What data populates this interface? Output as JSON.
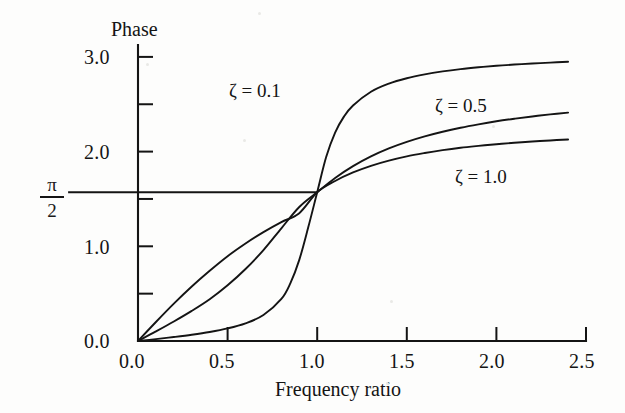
{
  "figure": {
    "background_color": "#fdfdfc",
    "ink_color": "#141414"
  },
  "chart_data": {
    "type": "line",
    "title": "",
    "xlabel": "Frequency ratio",
    "ylabel": "Phase",
    "xlim": [
      0.0,
      2.5
    ],
    "ylim": [
      0.0,
      3.2
    ],
    "xticks": [
      0.0,
      0.5,
      1.0,
      1.5,
      2.0,
      2.5
    ],
    "xtick_labels": [
      "0.0",
      "0.5",
      "1.0",
      "1.5",
      "2.0",
      "2.5"
    ],
    "yticks": [
      0.0,
      1.0,
      2.0,
      3.0
    ],
    "ytick_labels": [
      "0.0",
      "1.0",
      "2.0",
      "3.0"
    ],
    "yminor_ticks": [
      0.5,
      1.5,
      2.5
    ],
    "grid": false,
    "legend_position": "inline-annotations",
    "reference_lines": [
      {
        "name": "pi-over-two",
        "orientation": "horizontal",
        "value": 1.5708,
        "label_numerator": "π",
        "label_denominator": "2",
        "x_start": -0.39,
        "x_end": 1.0
      }
    ],
    "series": [
      {
        "name": "ζ = 0.1",
        "zeta": 0.1,
        "label": "ζ = 0.1",
        "x": [
          0.0,
          0.1,
          0.2,
          0.3,
          0.4,
          0.5,
          0.6,
          0.7,
          0.8,
          0.85,
          0.9,
          0.95,
          1.0,
          1.05,
          1.1,
          1.15,
          1.2,
          1.3,
          1.4,
          1.5,
          1.6,
          1.7,
          1.8,
          1.9,
          2.0,
          2.1,
          2.2,
          2.3,
          2.4
        ],
        "y": [
          0.0,
          0.02,
          0.042,
          0.066,
          0.095,
          0.133,
          0.187,
          0.274,
          0.444,
          0.609,
          0.857,
          1.2,
          1.571,
          1.942,
          2.201,
          2.372,
          2.487,
          2.632,
          2.718,
          2.775,
          2.816,
          2.847,
          2.871,
          2.89,
          2.906,
          2.919,
          2.93,
          2.94,
          2.948
        ]
      },
      {
        "name": "ζ = 0.5",
        "zeta": 0.5,
        "label": "ζ = 0.5",
        "x": [
          0.0,
          0.1,
          0.2,
          0.3,
          0.4,
          0.5,
          0.6,
          0.7,
          0.8,
          0.9,
          1.0,
          1.1,
          1.2,
          1.3,
          1.4,
          1.5,
          1.6,
          1.7,
          1.8,
          1.9,
          2.0,
          2.1,
          2.2,
          2.3,
          2.4
        ],
        "y": [
          0.0,
          0.101,
          0.206,
          0.318,
          0.441,
          0.588,
          0.76,
          0.96,
          1.19,
          1.415,
          1.571,
          1.722,
          1.847,
          1.95,
          2.034,
          2.103,
          2.161,
          2.21,
          2.252,
          2.288,
          2.32,
          2.347,
          2.371,
          2.393,
          2.412
        ]
      },
      {
        "name": "ζ = 1.0",
        "zeta": 1.0,
        "label": "ζ = 1.0",
        "x": [
          0.0,
          0.1,
          0.2,
          0.3,
          0.4,
          0.5,
          0.6,
          0.7,
          0.8,
          0.9,
          1.0,
          1.1,
          1.2,
          1.3,
          1.4,
          1.5,
          1.6,
          1.7,
          1.8,
          1.9,
          2.0,
          2.1,
          2.2,
          2.3,
          2.4
        ],
        "y": [
          0.0,
          0.201,
          0.395,
          0.576,
          0.742,
          0.896,
          1.03,
          1.15,
          1.256,
          1.35,
          1.571,
          1.69,
          1.78,
          1.85,
          1.905,
          1.95,
          1.985,
          2.015,
          2.04,
          2.06,
          2.078,
          2.093,
          2.106,
          2.118,
          2.128
        ]
      }
    ],
    "annotations": [
      {
        "name": "zeta-0-1-label",
        "text": "ζ = 0.1",
        "x": 0.63,
        "y": 2.82
      },
      {
        "name": "zeta-0-5-label",
        "text": "ζ = 0.5",
        "x": 1.78,
        "y": 2.66
      },
      {
        "name": "zeta-1-0-label",
        "text": "ζ = 1.0",
        "x": 1.99,
        "y": 1.92
      }
    ]
  },
  "axes": {
    "y_title": "Phase",
    "x_title": "Frequency ratio",
    "pi_over_2": {
      "numerator": "π",
      "denominator": "2"
    }
  }
}
